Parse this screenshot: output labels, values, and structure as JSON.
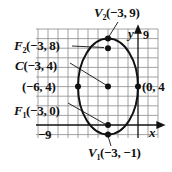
{
  "diagram": {
    "type": "ellipse-graph",
    "colors": {
      "ink": "#111111",
      "grid": "#8a8a8a",
      "background": "#ffffff"
    },
    "axes": {
      "x_label": "x",
      "y_label": "y",
      "x_min_tick": "−9",
      "y_max_tick": "9"
    },
    "points": [
      {
        "name": "V2",
        "label_sym": "V",
        "label_sub": "2",
        "coords": "(−3, 9)",
        "x": -3,
        "y": 9
      },
      {
        "name": "F2",
        "label_sym": "F",
        "label_sub": "2",
        "coords": "(−3, 8)",
        "x": -3,
        "y": 8
      },
      {
        "name": "C",
        "label_sym": "C",
        "label_sub": "",
        "coords": "(−3, 4)",
        "x": -3,
        "y": 4
      },
      {
        "name": "left-vertex",
        "label_sym": "",
        "label_sub": "",
        "coords": "(−6, 4)",
        "x": -6,
        "y": 4
      },
      {
        "name": "right-vertex",
        "label_sym": "",
        "label_sub": "",
        "coords": "(0, 4",
        "x": 0,
        "y": 4
      },
      {
        "name": "F1",
        "label_sym": "F",
        "label_sub": "1",
        "coords": "(−3, 0)",
        "x": -3,
        "y": 0
      },
      {
        "name": "V1",
        "label_sym": "V",
        "label_sub": "1",
        "coords": "(−3, −1)",
        "x": -3,
        "y": -1
      }
    ]
  }
}
